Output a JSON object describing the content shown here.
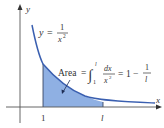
{
  "figure": {
    "curve_label": {
      "lhs": "y",
      "eq": "=",
      "num": "1",
      "den": "x",
      "den_exp": "2"
    },
    "area_label": {
      "word": "Area",
      "eq": "=",
      "integral_upper": "l",
      "integral_lower": "1",
      "integrand_num": "dx",
      "integrand_den": "x",
      "integrand_den_exp": "2",
      "result_eq": "=",
      "result_one": "1",
      "result_minus": "−",
      "result_num": "1",
      "result_den": "l"
    },
    "axes": {
      "x_label": "x",
      "y_label": "y"
    },
    "ticks": {
      "one": "1",
      "l": "l"
    },
    "colors": {
      "curve": "#3a5fb0",
      "shade": "#8fb0e3",
      "axis": "#555555"
    }
  }
}
